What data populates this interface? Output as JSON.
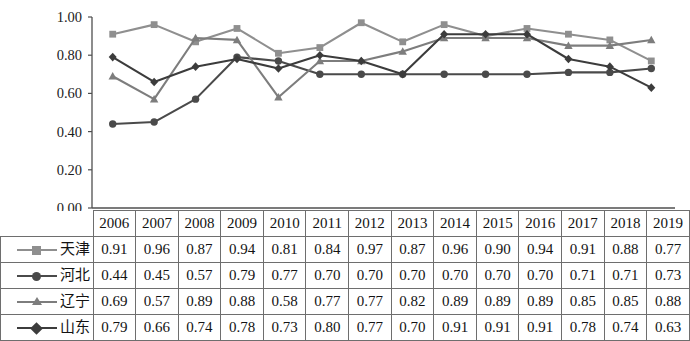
{
  "chart_data": {
    "type": "line",
    "title": "",
    "subtitle": "",
    "xlabel": "",
    "ylabel": "",
    "ylim": [
      0.0,
      1.0
    ],
    "ytick_labels": [
      "0.00",
      "0.20",
      "0.40",
      "0.60",
      "0.80",
      "1.00"
    ],
    "ytick_values": [
      0.0,
      0.2,
      0.4,
      0.6,
      0.8,
      1.0
    ],
    "grid": false,
    "legend_position": "table-left-column",
    "categories": [
      "2006",
      "2007",
      "2008",
      "2009",
      "2010",
      "2011",
      "2012",
      "2013",
      "2014",
      "2015",
      "2016",
      "2017",
      "2018",
      "2019"
    ],
    "series": [
      {
        "name": "天津",
        "marker": "square",
        "color": "#8f8f8f",
        "values": [
          0.91,
          0.96,
          0.87,
          0.94,
          0.81,
          0.84,
          0.97,
          0.87,
          0.96,
          0.9,
          0.94,
          0.91,
          0.88,
          0.77
        ]
      },
      {
        "name": "河北",
        "marker": "circle",
        "color": "#4a4a4a",
        "values": [
          0.44,
          0.45,
          0.57,
          0.79,
          0.77,
          0.7,
          0.7,
          0.7,
          0.7,
          0.7,
          0.7,
          0.71,
          0.71,
          0.73
        ]
      },
      {
        "name": "辽宁",
        "marker": "triangle",
        "color": "#7d7d7d",
        "values": [
          0.69,
          0.57,
          0.89,
          0.88,
          0.58,
          0.77,
          0.77,
          0.82,
          0.89,
          0.89,
          0.89,
          0.85,
          0.85,
          0.88
        ]
      },
      {
        "name": "山东",
        "marker": "diamond",
        "color": "#3c3c3c",
        "values": [
          0.79,
          0.66,
          0.74,
          0.78,
          0.73,
          0.8,
          0.77,
          0.7,
          0.91,
          0.91,
          0.91,
          0.78,
          0.74,
          0.63
        ]
      }
    ]
  },
  "table": {
    "corner_label": "",
    "year_header": [
      "2006",
      "2007",
      "2008",
      "2009",
      "2010",
      "2011",
      "2012",
      "2013",
      "2014",
      "2015",
      "2016",
      "2017",
      "2018",
      "2019"
    ],
    "rows": [
      {
        "label": "天津",
        "values": [
          "0.91",
          "0.96",
          "0.87",
          "0.94",
          "0.81",
          "0.84",
          "0.97",
          "0.87",
          "0.96",
          "0.90",
          "0.94",
          "0.91",
          "0.88",
          "0.77"
        ]
      },
      {
        "label": "河北",
        "values": [
          "0.44",
          "0.45",
          "0.57",
          "0.79",
          "0.77",
          "0.70",
          "0.70",
          "0.70",
          "0.70",
          "0.70",
          "0.70",
          "0.71",
          "0.71",
          "0.73"
        ]
      },
      {
        "label": "辽宁",
        "values": [
          "0.69",
          "0.57",
          "0.89",
          "0.88",
          "0.58",
          "0.77",
          "0.77",
          "0.82",
          "0.89",
          "0.89",
          "0.89",
          "0.85",
          "0.85",
          "0.88"
        ]
      },
      {
        "label": "山东",
        "values": [
          "0.79",
          "0.66",
          "0.74",
          "0.78",
          "0.73",
          "0.80",
          "0.77",
          "0.70",
          "0.91",
          "0.91",
          "0.91",
          "0.78",
          "0.74",
          "0.63"
        ]
      }
    ]
  },
  "colors": {
    "axis": "#4f4f4f",
    "border": "#6e6e6e",
    "text": "#131313",
    "tianjin": "#8f8f8f",
    "hebei": "#4a4a4a",
    "liaoning": "#7d7d7d",
    "shandong": "#3c3c3c"
  }
}
